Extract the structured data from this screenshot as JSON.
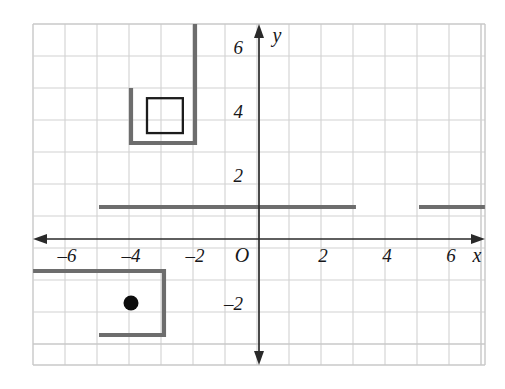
{
  "figure": {
    "type": "coordinate-grid-diagram"
  },
  "chart_data": {
    "type": "scatter",
    "title": "",
    "xlabel": "x",
    "ylabel": "y",
    "grid": true,
    "legend": null,
    "xlim": [
      -7.06,
      7.06
    ],
    "ylim": [
      -6.72,
      6.72
    ],
    "x_tick_labels": [
      "–6",
      "–4",
      "–2",
      "2",
      "4",
      "6"
    ],
    "x_tick_values": [
      -6,
      -4,
      -2,
      2,
      4,
      6
    ],
    "y_tick_labels": [
      "6",
      "4",
      "2",
      "–2"
    ],
    "y_tick_values": [
      6,
      4,
      2,
      -2
    ],
    "origin_label": "O",
    "unit_px": 32,
    "shapes": [
      {
        "name": "u-shape-upper-left",
        "kind": "polyline",
        "color": "#6d6d6d",
        "points": [
          [
            -4,
            4.72
          ],
          [
            -4,
            3.0
          ],
          [
            -2,
            3.0
          ],
          [
            -2,
            6.72
          ]
        ]
      },
      {
        "name": "inner-square",
        "kind": "rect",
        "color": "#1c1c1c",
        "x": -3.5,
        "y": 3.31,
        "width": 1.12,
        "height": 1.09
      },
      {
        "name": "horizontal-segment-left",
        "kind": "polyline",
        "color": "#6d6d6d",
        "points": [
          [
            -5,
            1.0
          ],
          [
            3.03,
            1.0
          ]
        ]
      },
      {
        "name": "horizontal-segment-right",
        "kind": "polyline",
        "color": "#6d6d6d",
        "points": [
          [
            5.0,
            1.0
          ],
          [
            7.06,
            1.0
          ]
        ]
      },
      {
        "name": "c-shape-lower-left",
        "kind": "polyline",
        "color": "#6d6d6d",
        "points": [
          [
            -7.06,
            -1.0
          ],
          [
            -2.97,
            -1.0
          ],
          [
            -2.97,
            -3.0
          ],
          [
            -5.0,
            -3.0
          ]
        ]
      },
      {
        "name": "plot-point",
        "kind": "point",
        "color": "#0d0d0d",
        "x": -4,
        "y": -2,
        "radius_px": 7.5
      }
    ],
    "points": [
      {
        "x": -4,
        "y": -2,
        "label": ""
      }
    ],
    "annotations": []
  },
  "axes": {
    "x_axis_name": "x",
    "y_axis_name": "y",
    "origin": "O"
  },
  "ticks": {
    "x": [
      {
        "value": -6,
        "label": "–6"
      },
      {
        "value": -4,
        "label": "–4"
      },
      {
        "value": -2,
        "label": "–2"
      },
      {
        "value": 2,
        "label": "2"
      },
      {
        "value": 4,
        "label": "4"
      },
      {
        "value": 6,
        "label": "6"
      }
    ],
    "y": [
      {
        "value": 6,
        "label": "6"
      },
      {
        "value": 4,
        "label": "4"
      },
      {
        "value": 2,
        "label": "2"
      },
      {
        "value": -2,
        "label": "–2"
      }
    ]
  },
  "colors": {
    "grid": "#d2d2d2",
    "axis": "#2a2a2a",
    "figure": "#6d6d6d",
    "inner_square": "#1c1c1c",
    "point": "#0d0d0d",
    "background": "#ffffff"
  }
}
